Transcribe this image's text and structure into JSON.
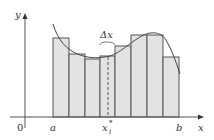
{
  "diagram": {
    "labels": {
      "y_axis": "y",
      "x_axis": "x",
      "origin": "0",
      "a": "a",
      "b": "b",
      "sample_point": "x",
      "sample_sup": "*",
      "sample_sub": "i",
      "delta": "Δx"
    },
    "colors": {
      "fill": "#e3e3e3",
      "stroke": "#555555",
      "axis": "#555555",
      "curve": "#444444"
    },
    "rectangles": [
      {
        "x0": 53,
        "x1": 69,
        "top": 38
      },
      {
        "x0": 69,
        "x1": 85,
        "top": 54
      },
      {
        "x0": 85,
        "x1": 100,
        "top": 59
      },
      {
        "x0": 100,
        "x1": 115,
        "top": 56
      },
      {
        "x0": 115,
        "x1": 131,
        "top": 46
      },
      {
        "x0": 131,
        "x1": 147,
        "top": 35
      },
      {
        "x0": 147,
        "x1": 163,
        "top": 35
      },
      {
        "x0": 163,
        "x1": 179,
        "top": 57
      }
    ],
    "baseline_y": 117,
    "sample_x": 108
  }
}
